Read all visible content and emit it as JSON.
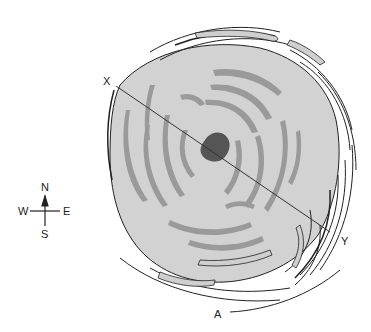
{
  "figure": {
    "caption": "A",
    "section_line": {
      "start_label": "X",
      "end_label": "Y"
    },
    "compass": {
      "north": "N",
      "south": "S",
      "east": "E",
      "west": "W"
    }
  },
  "colors": {
    "disc_fill": "#d2d2d2",
    "band_fill": "#9a9a9a",
    "eye_fill": "#555555",
    "outline": "#222222",
    "outer_band_fill": "#cfcfcf"
  }
}
